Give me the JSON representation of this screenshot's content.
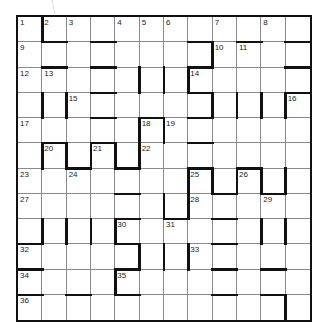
{
  "puzzle": {
    "type": "barred-crossword",
    "rows": 12,
    "cols": 12,
    "colors": {
      "grid_line": "#8a8a8a",
      "bar": "#111111",
      "background": "#ffffff"
    },
    "numbers": [
      {
        "n": "1",
        "r": 0,
        "c": 0
      },
      {
        "n": "2",
        "r": 0,
        "c": 1
      },
      {
        "n": "3",
        "r": 0,
        "c": 2
      },
      {
        "n": "4",
        "r": 0,
        "c": 4
      },
      {
        "n": "5",
        "r": 0,
        "c": 5
      },
      {
        "n": "6",
        "r": 0,
        "c": 6
      },
      {
        "n": "7",
        "r": 0,
        "c": 8
      },
      {
        "n": "8",
        "r": 0,
        "c": 10
      },
      {
        "n": "9",
        "r": 1,
        "c": 0
      },
      {
        "n": "10",
        "r": 1,
        "c": 8
      },
      {
        "n": "11",
        "r": 1,
        "c": 9
      },
      {
        "n": "12",
        "r": 2,
        "c": 0
      },
      {
        "n": "13",
        "r": 2,
        "c": 1
      },
      {
        "n": "14",
        "r": 2,
        "c": 7
      },
      {
        "n": "15",
        "r": 3,
        "c": 2
      },
      {
        "n": "16",
        "r": 3,
        "c": 11
      },
      {
        "n": "17",
        "r": 4,
        "c": 0
      },
      {
        "n": "18",
        "r": 4,
        "c": 5
      },
      {
        "n": "19",
        "r": 4,
        "c": 6
      },
      {
        "n": "20",
        "r": 5,
        "c": 1
      },
      {
        "n": "21",
        "r": 5,
        "c": 3
      },
      {
        "n": "22",
        "r": 5,
        "c": 5
      },
      {
        "n": "23",
        "r": 6,
        "c": 0
      },
      {
        "n": "24",
        "r": 6,
        "c": 2
      },
      {
        "n": "25",
        "r": 6,
        "c": 7
      },
      {
        "n": "26",
        "r": 6,
        "c": 9
      },
      {
        "n": "27",
        "r": 7,
        "c": 0
      },
      {
        "n": "28",
        "r": 7,
        "c": 7
      },
      {
        "n": "29",
        "r": 7,
        "c": 10
      },
      {
        "n": "30",
        "r": 8,
        "c": 4
      },
      {
        "n": "31",
        "r": 8,
        "c": 6
      },
      {
        "n": "32",
        "r": 9,
        "c": 0
      },
      {
        "n": "33",
        "r": 9,
        "c": 7
      },
      {
        "n": "34",
        "r": 10,
        "c": 0
      },
      {
        "n": "35",
        "r": 10,
        "c": 4
      },
      {
        "n": "36",
        "r": 11,
        "c": 0
      }
    ],
    "bars_right": [
      [
        0,
        0
      ],
      [
        1,
        7
      ],
      [
        2,
        4
      ],
      [
        2,
        5
      ],
      [
        2,
        6
      ],
      [
        3,
        0
      ],
      [
        3,
        1
      ],
      [
        3,
        7
      ],
      [
        3,
        8
      ],
      [
        3,
        9
      ],
      [
        3,
        10
      ],
      [
        4,
        4
      ],
      [
        4,
        5
      ],
      [
        5,
        0
      ],
      [
        5,
        1
      ],
      [
        5,
        2
      ],
      [
        5,
        3
      ],
      [
        5,
        4
      ],
      [
        6,
        6
      ],
      [
        6,
        7
      ],
      [
        6,
        8
      ],
      [
        6,
        9
      ],
      [
        6,
        10
      ],
      [
        7,
        5
      ],
      [
        7,
        6
      ],
      [
        8,
        0
      ],
      [
        8,
        1
      ],
      [
        8,
        2
      ],
      [
        8,
        3
      ],
      [
        8,
        9
      ],
      [
        8,
        10
      ],
      [
        9,
        4
      ],
      [
        9,
        5
      ],
      [
        9,
        6
      ],
      [
        10,
        3
      ],
      [
        11,
        10
      ]
    ],
    "bars_bottom": [
      [
        0,
        1
      ],
      [
        0,
        3
      ],
      [
        0,
        7
      ],
      [
        0,
        9
      ],
      [
        0,
        11
      ],
      [
        1,
        1
      ],
      [
        1,
        3
      ],
      [
        1,
        7
      ],
      [
        1,
        11
      ],
      [
        2,
        3
      ],
      [
        2,
        7
      ],
      [
        2,
        11
      ],
      [
        3,
        3
      ],
      [
        3,
        5
      ],
      [
        3,
        7
      ],
      [
        4,
        1
      ],
      [
        4,
        3
      ],
      [
        4,
        7
      ],
      [
        5,
        2
      ],
      [
        5,
        4
      ],
      [
        5,
        7
      ],
      [
        5,
        9
      ],
      [
        6,
        4
      ],
      [
        6,
        8
      ],
      [
        6,
        10
      ],
      [
        7,
        4
      ],
      [
        7,
        6
      ],
      [
        7,
        8
      ],
      [
        8,
        0
      ],
      [
        8,
        4
      ],
      [
        8,
        8
      ],
      [
        9,
        0
      ],
      [
        9,
        4
      ],
      [
        9,
        8
      ],
      [
        9,
        10
      ],
      [
        10,
        0
      ],
      [
        10,
        2
      ],
      [
        10,
        4
      ],
      [
        10,
        8
      ],
      [
        10,
        10
      ]
    ]
  }
}
